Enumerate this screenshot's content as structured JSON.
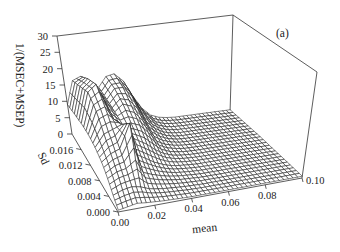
{
  "chart_data": {
    "type": "surface3d",
    "panel_label": "(a)",
    "title": "",
    "xlabel": "mean",
    "ylabel": "Sd",
    "zlabel": "1/(MSEC+MSEP)",
    "x_ticks": [
      "0.00",
      "0.02",
      "0.04",
      "0.06",
      "0.08",
      "0.10"
    ],
    "y_ticks": [
      "0.000",
      "0.004",
      "0.008",
      "0.012",
      "0.016"
    ],
    "z_ticks": [
      "0",
      "5",
      "10",
      "15",
      "20",
      "25",
      "30"
    ],
    "xlim": [
      0,
      0.1
    ],
    "ylim": [
      0,
      0.02
    ],
    "zlim": [
      0,
      30
    ],
    "grid": false,
    "legend": null,
    "x": [
      0.0,
      0.005,
      0.01,
      0.015,
      0.02,
      0.025,
      0.03,
      0.035,
      0.04,
      0.045,
      0.05,
      0.055,
      0.06,
      0.065,
      0.07,
      0.075,
      0.08,
      0.085,
      0.09,
      0.095,
      0.1
    ],
    "y": [
      0.0,
      0.0025,
      0.005,
      0.0075,
      0.01,
      0.0125,
      0.015,
      0.0175,
      0.02
    ],
    "z_rows_by_y": [
      [
        0.5,
        1.0,
        1.5,
        1.2,
        1.0,
        0.8,
        0.7,
        0.6,
        0.5,
        0.5,
        0.5,
        0.5,
        0.5,
        0.5,
        0.5,
        0.5,
        0.5,
        0.5,
        0.5,
        0.5,
        0.5
      ],
      [
        2.0,
        3.0,
        3.5,
        3.0,
        2.0,
        1.5,
        1.2,
        1.0,
        0.8,
        0.7,
        0.6,
        0.6,
        0.6,
        0.6,
        0.6,
        0.6,
        0.6,
        0.6,
        0.6,
        0.6,
        0.6
      ],
      [
        4.0,
        5.5,
        6.0,
        8.0,
        4.0,
        3.0,
        2.2,
        1.6,
        1.2,
        1.0,
        0.8,
        0.7,
        0.7,
        0.7,
        0.7,
        0.7,
        0.7,
        0.7,
        0.7,
        0.7,
        0.7
      ],
      [
        6.0,
        8.0,
        9.0,
        16.0,
        6.5,
        5.0,
        3.5,
        2.4,
        1.6,
        1.2,
        1.0,
        0.8,
        0.8,
        0.8,
        0.8,
        0.8,
        0.8,
        0.8,
        0.8,
        0.8,
        0.8
      ],
      [
        7.5,
        11.0,
        12.0,
        13.0,
        9.0,
        7.5,
        6.0,
        4.0,
        2.5,
        1.6,
        1.2,
        1.0,
        0.9,
        0.9,
        0.9,
        0.9,
        0.9,
        0.9,
        0.9,
        0.9,
        0.9
      ],
      [
        8.5,
        15.0,
        16.0,
        12.0,
        10.0,
        10.0,
        9.0,
        6.5,
        3.5,
        2.2,
        1.5,
        1.1,
        1.0,
        1.0,
        1.0,
        1.0,
        1.0,
        1.0,
        1.0,
        1.0,
        1.0
      ],
      [
        9.0,
        18.0,
        20.0,
        14.0,
        11.0,
        13.0,
        12.0,
        9.0,
        5.0,
        3.0,
        1.8,
        1.2,
        1.0,
        1.0,
        1.0,
        1.0,
        1.0,
        1.0,
        1.0,
        1.0,
        1.0
      ],
      [
        9.0,
        17.0,
        19.0,
        15.0,
        12.0,
        15.0,
        15.0,
        12.0,
        7.0,
        4.0,
        2.2,
        1.4,
        1.1,
        1.0,
        1.0,
        1.0,
        1.0,
        1.0,
        1.0,
        1.0,
        1.0
      ],
      [
        9.0,
        16.0,
        17.0,
        15.0,
        13.0,
        16.0,
        16.5,
        14.0,
        9.0,
        5.0,
        2.6,
        1.6,
        1.2,
        1.0,
        1.0,
        1.0,
        1.0,
        1.0,
        1.0,
        1.0,
        1.0
      ]
    ]
  },
  "projection": {
    "floor": {
      "x0y0": [
        118,
        212
      ],
      "x1y0": [
        302,
        178
      ],
      "x0y1": [
        72,
        134
      ],
      "x1y1": [
        230,
        113
      ]
    },
    "top": {
      "x0y0": [
        134,
        106
      ],
      "x1y0": [
        317,
        72
      ],
      "x0y1": [
        57,
        36
      ],
      "x1y1": [
        233,
        15
      ]
    }
  },
  "labels": {
    "zlabel": "1/(MSEC+MSEP)",
    "ylabel": "Sd",
    "xlabel": "mean",
    "panel": "(a)"
  }
}
